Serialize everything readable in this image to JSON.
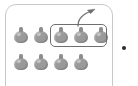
{
  "canvas": {
    "width": 138,
    "height": 86,
    "background": "#ffffff"
  },
  "panel": {
    "name": "object-tray-panel",
    "border_color": "#c9c9c9",
    "fill_color": "#ffffff",
    "corner_radius": 11,
    "cropped_at_bottom": true
  },
  "objects": {
    "icon_name": "round-object-icon",
    "fill_color": "#9a9a9a",
    "stem_color": "#8e8e8e",
    "rows": [
      {
        "row_label": "top-row",
        "count": 5,
        "items": [
          {
            "index": 1,
            "selected": false
          },
          {
            "index": 2,
            "selected": false
          },
          {
            "index": 3,
            "selected": true
          },
          {
            "index": 4,
            "selected": true
          },
          {
            "index": 5,
            "selected": true
          }
        ]
      },
      {
        "row_label": "bottom-row",
        "count": 4,
        "items": [
          {
            "index": 1,
            "selected": false
          },
          {
            "index": 2,
            "selected": false
          },
          {
            "index": 3,
            "selected": false
          },
          {
            "index": 4,
            "selected": false
          }
        ]
      }
    ]
  },
  "selection": {
    "name": "selection-rectangle",
    "border_color": "#6f6f6f",
    "selected_count": 3,
    "target_row": "top-row"
  },
  "annotation_arrow": {
    "name": "curved-arrow",
    "color": "#6f6f6f",
    "direction": "up-right",
    "origin": "selection-rectangle",
    "head_x": 95,
    "head_y": 9
  },
  "marker": {
    "name": "marker-dot",
    "color": "#2b2b2b",
    "x": 124,
    "y": 48
  }
}
